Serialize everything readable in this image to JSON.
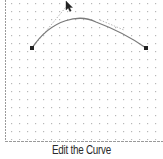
{
  "caption": "Edit the Curve",
  "colors": {
    "grid_dot": "#b8b8b8",
    "border": "#9a9a9a",
    "curve": "#7a7a7a",
    "handle_line": "#a0a0a0",
    "anchor": "#222222",
    "caption": "#2a2a2a"
  },
  "curve": {
    "start_anchor": {
      "x": 32,
      "y": 48
    },
    "end_anchor": {
      "x": 146,
      "y": 48
    },
    "control_point_1": {
      "x": 68,
      "y": 4
    },
    "control_point_2": {
      "x": 112,
      "y": 14
    }
  },
  "cursor": {
    "icon": "arrow-cursor-icon",
    "x": 68,
    "y": 4
  }
}
